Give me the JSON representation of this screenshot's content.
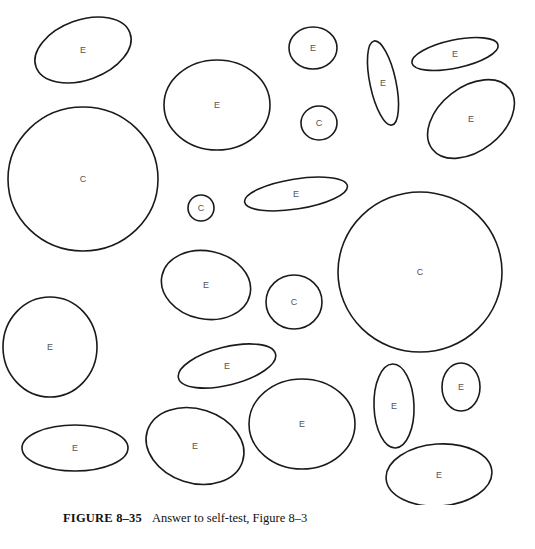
{
  "figure": {
    "shapes": [
      {
        "id": 1,
        "label": "E",
        "cx": 83,
        "cy": 50,
        "rx": 50,
        "ry": 30,
        "rot": -20
      },
      {
        "id": 2,
        "label": "E",
        "cx": 217,
        "cy": 105,
        "rx": 53,
        "ry": 45,
        "rot": 0
      },
      {
        "id": 3,
        "label": "C",
        "cx": 83,
        "cy": 179,
        "rx": 75,
        "ry": 72,
        "rot": 0
      },
      {
        "id": 4,
        "label": "C",
        "cx": 201,
        "cy": 208,
        "rx": 13,
        "ry": 13,
        "rot": 0
      },
      {
        "id": 5,
        "label": "E",
        "cx": 313,
        "cy": 48,
        "rx": 24,
        "ry": 21,
        "rot": 0
      },
      {
        "id": 6,
        "label": "C",
        "cx": 319,
        "cy": 123,
        "rx": 18,
        "ry": 17,
        "rot": 0
      },
      {
        "id": 7,
        "label": "E",
        "cx": 383,
        "cy": 83,
        "rx": 13,
        "ry": 43,
        "rot": -12
      },
      {
        "id": 8,
        "label": "E",
        "cx": 455,
        "cy": 54,
        "rx": 44,
        "ry": 14,
        "rot": -12
      },
      {
        "id": 9,
        "label": "E",
        "cx": 471,
        "cy": 119,
        "rx": 49,
        "ry": 32,
        "rot": -38
      },
      {
        "id": 10,
        "label": "E",
        "cx": 296,
        "cy": 194,
        "rx": 52,
        "ry": 15,
        "rot": -9
      },
      {
        "id": 11,
        "label": "E",
        "cx": 206,
        "cy": 285,
        "rx": 45,
        "ry": 34,
        "rot": 12
      },
      {
        "id": 12,
        "label": "C",
        "cx": 294,
        "cy": 302,
        "rx": 28,
        "ry": 27,
        "rot": 0
      },
      {
        "id": 13,
        "label": "C",
        "cx": 420,
        "cy": 272,
        "rx": 82,
        "ry": 80,
        "rot": 0
      },
      {
        "id": 14,
        "label": "E",
        "cx": 50,
        "cy": 347,
        "rx": 47,
        "ry": 50,
        "rot": 0
      },
      {
        "id": 15,
        "label": "E",
        "cx": 227,
        "cy": 366,
        "rx": 50,
        "ry": 19,
        "rot": -14
      },
      {
        "id": 16,
        "label": "E",
        "cx": 75,
        "cy": 448,
        "rx": 53,
        "ry": 23,
        "rot": 0
      },
      {
        "id": 17,
        "label": "E",
        "cx": 195,
        "cy": 446,
        "rx": 50,
        "ry": 37,
        "rot": 18
      },
      {
        "id": 18,
        "label": "E",
        "cx": 302,
        "cy": 424,
        "rx": 53,
        "ry": 45,
        "rot": 0
      },
      {
        "id": 19,
        "label": "E",
        "cx": 394,
        "cy": 406,
        "rx": 20,
        "ry": 42,
        "rot": -2
      },
      {
        "id": 20,
        "label": "E",
        "cx": 461,
        "cy": 387,
        "rx": 19,
        "ry": 24,
        "rot": 0
      },
      {
        "id": 21,
        "label": "E",
        "cx": 439,
        "cy": 475,
        "rx": 53,
        "ry": 31,
        "rot": -4
      }
    ]
  },
  "caption": {
    "figure_number": "FIGURE 8–35",
    "text": "Answer to self-test, Figure 8–3"
  }
}
